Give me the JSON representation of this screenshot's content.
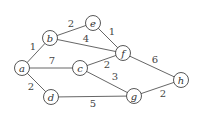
{
  "graph": {
    "node_radius": 7.5,
    "nodes": [
      {
        "id": "a",
        "label": "a",
        "x": 22,
        "y": 68
      },
      {
        "id": "b",
        "label": "b",
        "x": 50,
        "y": 38
      },
      {
        "id": "e",
        "label": "e",
        "x": 93,
        "y": 23
      },
      {
        "id": "f",
        "label": "f",
        "x": 123,
        "y": 53
      },
      {
        "id": "c",
        "label": "c",
        "x": 80,
        "y": 68
      },
      {
        "id": "d",
        "label": "d",
        "x": 51,
        "y": 97
      },
      {
        "id": "g",
        "label": "g",
        "x": 134,
        "y": 96
      },
      {
        "id": "h",
        "label": "h",
        "x": 181,
        "y": 80
      }
    ],
    "edges": [
      {
        "from": "a",
        "to": "b",
        "weight": "1",
        "lx": 33,
        "ly": 50
      },
      {
        "from": "a",
        "to": "c",
        "weight": "7",
        "lx": 52,
        "ly": 64
      },
      {
        "from": "a",
        "to": "d",
        "weight": "2",
        "lx": 31,
        "ly": 90
      },
      {
        "from": "b",
        "to": "e",
        "weight": "2",
        "lx": 71,
        "ly": 27
      },
      {
        "from": "b",
        "to": "f",
        "weight": "4",
        "lx": 86,
        "ly": 42
      },
      {
        "from": "e",
        "to": "f",
        "weight": "1",
        "lx": 112,
        "ly": 35
      },
      {
        "from": "c",
        "to": "f",
        "weight": "2",
        "lx": 107,
        "ly": 68
      },
      {
        "from": "c",
        "to": "g",
        "weight": "3",
        "lx": 115,
        "ly": 80
      },
      {
        "from": "d",
        "to": "g",
        "weight": "5",
        "lx": 93,
        "ly": 107
      },
      {
        "from": "f",
        "to": "h",
        "weight": "6",
        "lx": 155,
        "ly": 63
      },
      {
        "from": "g",
        "to": "h",
        "weight": "2",
        "lx": 163,
        "ly": 97
      }
    ]
  }
}
